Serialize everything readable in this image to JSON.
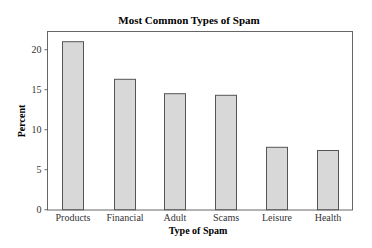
{
  "chart_data": {
    "type": "bar",
    "title": "Most Common Types of Spam",
    "xlabel": "Type of Spam",
    "ylabel": "Percent",
    "categories": [
      "Products",
      "Financial",
      "Adult",
      "Scams",
      "Leisure",
      "Health"
    ],
    "values": [
      21.0,
      16.3,
      14.5,
      14.3,
      7.8,
      7.4
    ],
    "ylim": [
      0,
      22.3
    ],
    "yticks": [
      0,
      5,
      10,
      15,
      20
    ],
    "grid": false,
    "legend": null,
    "colors": {
      "bar_fill": "#d8d8d8",
      "bar_stroke": "#555555",
      "frame": "#666666",
      "background": "#ffffff"
    }
  }
}
